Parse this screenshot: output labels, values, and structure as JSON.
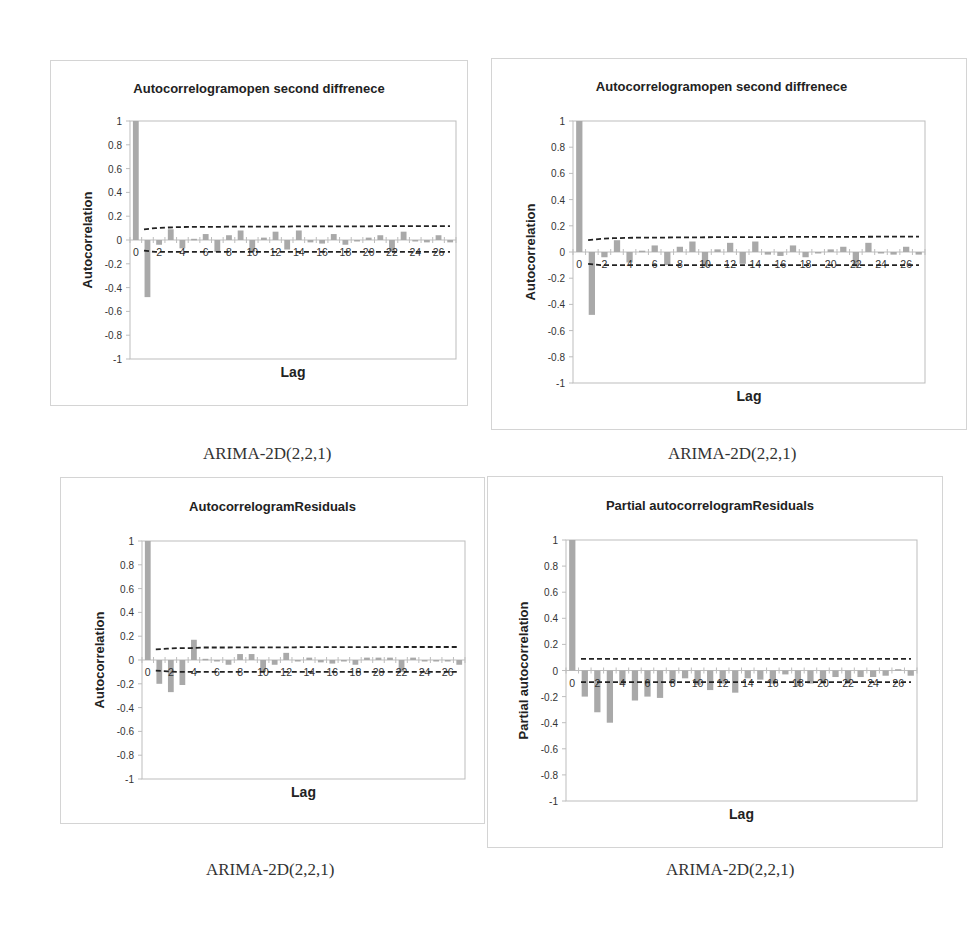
{
  "chart_data": [
    {
      "type": "bar",
      "title": "Autocorrelogramopen second diffrenece",
      "xlabel": "Lag",
      "ylabel": "Autocorrelation",
      "ylim": [
        -1,
        1
      ],
      "yticks": [
        "1",
        "0.8",
        "0.6",
        "0.4",
        "0.2",
        "0",
        "-0.2",
        "-0.4",
        "-0.6",
        "-0.8",
        "-1"
      ],
      "xticks": [
        "0",
        "2",
        "4",
        "6",
        "8",
        "10",
        "12",
        "14",
        "16",
        "18",
        "20",
        "22",
        "24",
        "26"
      ],
      "categories": [
        0,
        1,
        2,
        3,
        4,
        5,
        6,
        7,
        8,
        9,
        10,
        11,
        12,
        13,
        14,
        15,
        16,
        17,
        18,
        19,
        20,
        21,
        22,
        23,
        24,
        25,
        26,
        27
      ],
      "values": [
        1.0,
        -0.48,
        -0.04,
        0.09,
        -0.07,
        0.01,
        0.05,
        -0.1,
        0.04,
        0.08,
        -0.1,
        0.02,
        0.07,
        -0.08,
        0.08,
        -0.02,
        -0.03,
        0.05,
        -0.04,
        0.0,
        0.02,
        0.04,
        -0.1,
        0.07,
        0.0,
        -0.02,
        0.04,
        -0.02
      ],
      "confidence_upper": [
        null,
        0.09,
        0.1,
        0.105,
        0.108,
        0.11,
        0.11,
        0.11,
        0.112,
        0.112,
        0.112,
        0.113,
        0.113,
        0.113,
        0.114,
        0.114,
        0.114,
        0.115,
        0.115,
        0.115,
        0.115,
        0.116,
        0.116,
        0.116,
        0.117,
        0.117,
        0.117,
        0.117
      ],
      "confidence_lower": [
        null,
        -0.09,
        -0.1,
        -0.1,
        -0.1,
        -0.1,
        -0.1,
        -0.1,
        -0.1,
        -0.1,
        -0.1,
        -0.1,
        -0.1,
        -0.1,
        -0.1,
        -0.1,
        -0.1,
        -0.1,
        -0.1,
        -0.1,
        -0.1,
        -0.1,
        -0.1,
        -0.1,
        -0.1,
        -0.1,
        -0.1,
        -0.1
      ],
      "caption": "ARIMA-2D(2,2,1)",
      "grid": false
    },
    {
      "type": "bar",
      "title": "Autocorrelogramopen second diffrenece",
      "xlabel": "Lag",
      "ylabel": "Autocorrelation",
      "ylim": [
        -1,
        1
      ],
      "yticks": [
        "1",
        "0.8",
        "0.6",
        "0.4",
        "0.2",
        "0",
        "-0.2",
        "-0.4",
        "-0.6",
        "-0.8",
        "-1"
      ],
      "xticks": [
        "0",
        "2",
        "4",
        "6",
        "8",
        "10",
        "12",
        "14",
        "16",
        "18",
        "20",
        "22",
        "24",
        "26"
      ],
      "categories": [
        0,
        1,
        2,
        3,
        4,
        5,
        6,
        7,
        8,
        9,
        10,
        11,
        12,
        13,
        14,
        15,
        16,
        17,
        18,
        19,
        20,
        21,
        22,
        23,
        24,
        25,
        26,
        27
      ],
      "values": [
        1.0,
        -0.48,
        -0.04,
        0.09,
        -0.08,
        0.01,
        0.05,
        -0.1,
        0.04,
        0.08,
        -0.11,
        0.02,
        0.07,
        -0.09,
        0.08,
        -0.02,
        -0.03,
        0.05,
        -0.04,
        0.0,
        0.02,
        0.04,
        -0.11,
        0.07,
        -0.01,
        -0.02,
        0.04,
        -0.02
      ],
      "confidence_upper": [
        null,
        0.09,
        0.1,
        0.105,
        0.108,
        0.11,
        0.11,
        0.11,
        0.112,
        0.112,
        0.112,
        0.113,
        0.113,
        0.113,
        0.114,
        0.114,
        0.114,
        0.115,
        0.115,
        0.115,
        0.115,
        0.116,
        0.116,
        0.116,
        0.117,
        0.117,
        0.117,
        0.117
      ],
      "confidence_lower": [
        null,
        -0.09,
        -0.1,
        -0.1,
        -0.1,
        -0.1,
        -0.1,
        -0.1,
        -0.1,
        -0.1,
        -0.1,
        -0.1,
        -0.1,
        -0.1,
        -0.1,
        -0.1,
        -0.1,
        -0.1,
        -0.1,
        -0.1,
        -0.1,
        -0.1,
        -0.1,
        -0.1,
        -0.1,
        -0.1,
        -0.1,
        -0.1
      ],
      "caption": "ARIMA-2D(2,2,1)",
      "grid": false
    },
    {
      "type": "bar",
      "title": "AutocorrelogramResiduals",
      "xlabel": "Lag",
      "ylabel": "Autocorrelation",
      "ylim": [
        -1,
        1
      ],
      "yticks": [
        "1",
        "0.8",
        "0.6",
        "0.4",
        "0.2",
        "0",
        "-0.2",
        "-0.4",
        "-0.6",
        "-0.8",
        "-1"
      ],
      "xticks": [
        "0",
        "2",
        "4",
        "6",
        "8",
        "10",
        "12",
        "14",
        "16",
        "18",
        "20",
        "22",
        "24",
        "26"
      ],
      "categories": [
        0,
        1,
        2,
        3,
        4,
        5,
        6,
        7,
        8,
        9,
        10,
        11,
        12,
        13,
        14,
        15,
        16,
        17,
        18,
        19,
        20,
        21,
        22,
        23,
        24,
        25,
        26,
        27
      ],
      "values": [
        1.0,
        -0.2,
        -0.27,
        -0.21,
        0.17,
        0.01,
        0.0,
        -0.04,
        0.05,
        0.05,
        -0.1,
        -0.04,
        0.06,
        0.0,
        0.02,
        -0.02,
        -0.03,
        0.0,
        -0.04,
        0.02,
        0.02,
        0.02,
        -0.1,
        0.02,
        0.0,
        0.0,
        0.0,
        -0.04
      ],
      "confidence_upper": [
        null,
        0.09,
        0.095,
        0.1,
        0.1,
        0.105,
        0.105,
        0.105,
        0.106,
        0.106,
        0.107,
        0.107,
        0.107,
        0.107,
        0.108,
        0.108,
        0.108,
        0.108,
        0.108,
        0.108,
        0.108,
        0.109,
        0.109,
        0.109,
        0.109,
        0.109,
        0.109,
        0.109
      ],
      "confidence_lower": [
        null,
        -0.09,
        -0.095,
        -0.1,
        -0.1,
        -0.1,
        -0.1,
        -0.1,
        -0.1,
        -0.1,
        -0.1,
        -0.1,
        -0.1,
        -0.1,
        -0.1,
        -0.1,
        -0.1,
        -0.1,
        -0.1,
        -0.1,
        -0.1,
        -0.1,
        -0.1,
        -0.1,
        -0.1,
        -0.1,
        -0.1,
        -0.1
      ],
      "caption": "ARIMA-2D(2,2,1)",
      "grid": false
    },
    {
      "type": "bar",
      "title": "Partial autocorrelogramResiduals",
      "xlabel": "Lag",
      "ylabel": "Partial autocorrelation",
      "ylim": [
        -1,
        1
      ],
      "yticks": [
        "1",
        "0.8",
        "0.6",
        "0.4",
        "0.2",
        "0",
        "-0.2",
        "-0.4",
        "-0.6",
        "-0.8",
        "-1"
      ],
      "xticks": [
        "0",
        "2",
        "4",
        "6",
        "8",
        "10",
        "12",
        "14",
        "16",
        "18",
        "20",
        "22",
        "24",
        "26"
      ],
      "categories": [
        0,
        1,
        2,
        3,
        4,
        5,
        6,
        7,
        8,
        9,
        10,
        11,
        12,
        13,
        14,
        15,
        16,
        17,
        18,
        19,
        20,
        21,
        22,
        23,
        24,
        25,
        26,
        27
      ],
      "values": [
        1.0,
        -0.2,
        -0.32,
        -0.4,
        -0.11,
        -0.23,
        -0.2,
        -0.21,
        -0.1,
        -0.06,
        -0.11,
        -0.15,
        -0.1,
        -0.17,
        -0.06,
        -0.07,
        -0.1,
        -0.03,
        -0.12,
        -0.1,
        -0.1,
        -0.05,
        -0.1,
        -0.05,
        -0.05,
        -0.04,
        0.01,
        -0.04
      ],
      "confidence_upper": [
        null,
        0.09,
        0.09,
        0.09,
        0.09,
        0.09,
        0.09,
        0.09,
        0.09,
        0.09,
        0.09,
        0.09,
        0.09,
        0.09,
        0.09,
        0.09,
        0.09,
        0.09,
        0.09,
        0.09,
        0.09,
        0.09,
        0.09,
        0.09,
        0.09,
        0.09,
        0.09,
        0.09
      ],
      "confidence_lower": [
        null,
        -0.09,
        -0.09,
        -0.09,
        -0.09,
        -0.09,
        -0.09,
        -0.09,
        -0.09,
        -0.09,
        -0.09,
        -0.09,
        -0.09,
        -0.09,
        -0.09,
        -0.09,
        -0.09,
        -0.09,
        -0.09,
        -0.09,
        -0.09,
        -0.09,
        -0.09,
        -0.09,
        -0.09,
        -0.09,
        -0.09,
        -0.09
      ],
      "caption": "ARIMA-2D(2,2,1)",
      "grid": false
    }
  ],
  "panels": [
    {
      "title": "Autocorrelogramopen second diffrenece",
      "ylabel": "Autocorrelation",
      "xlabel": "Lag",
      "caption": "ARIMA-2D(2,2,1)"
    },
    {
      "title": "Autocorrelogramopen second diffrenece",
      "ylabel": "Autocorrelation",
      "xlabel": "Lag",
      "caption": "ARIMA-2D(2,2,1)"
    },
    {
      "title": "AutocorrelogramResiduals",
      "ylabel": "Autocorrelation",
      "xlabel": "Lag",
      "caption": "ARIMA-2D(2,2,1)"
    },
    {
      "title": "Partial autocorrelogramResiduals",
      "ylabel": "Partial autocorrelation",
      "xlabel": "Lag",
      "caption": "ARIMA-2D(2,2,1)"
    }
  ],
  "colors": {
    "bar": "#a9a9a9",
    "confidence_line": "#222222",
    "axis": "#bdbdbd",
    "frame": "#d4d4d4",
    "text": "#333333"
  }
}
